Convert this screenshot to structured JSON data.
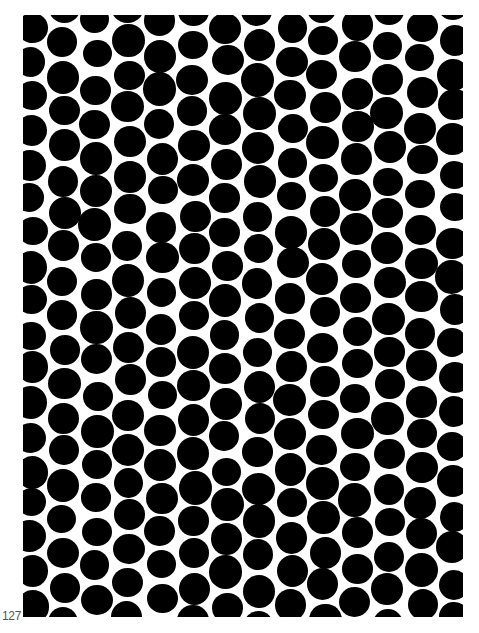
{
  "page": {
    "page_number": "127",
    "background_color": "#ffffff",
    "ink_color": "#000000"
  },
  "pattern": {
    "name": "black-dot-pattern",
    "frame": {
      "left": 23,
      "top": 15,
      "width": 440,
      "height": 602
    },
    "dot_diameter": 31,
    "column_spacing": 32.5,
    "row_spacing": 34,
    "column_offset_fraction": 0.5,
    "jitter": 4,
    "seed": 127
  }
}
